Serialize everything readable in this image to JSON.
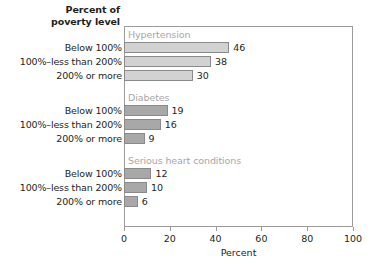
{
  "header": {
    "line1": "Percent of",
    "line2": "poverty level"
  },
  "axis": {
    "x_label": "Percent",
    "ticks": [
      "0",
      "20",
      "40",
      "60",
      "80",
      "100"
    ]
  },
  "colors": {
    "bar_light": "#d2d2d2",
    "bar_dark": "#a8a8a8",
    "bar_border": "#8a8a8a",
    "group_header": "#a6a6a6",
    "frame": "#9b9b9b",
    "text": "#231f20"
  },
  "groups": [
    {
      "name": "Hypertension",
      "tone": "light",
      "rows": [
        {
          "label": "Below 100%",
          "value": 46,
          "value_text": "46"
        },
        {
          "label": "100%–less than 200%",
          "value": 38,
          "value_text": "38"
        },
        {
          "label": "200% or more",
          "value": 30,
          "value_text": "30"
        }
      ]
    },
    {
      "name": "Diabetes",
      "tone": "dark",
      "rows": [
        {
          "label": "Below 100%",
          "value": 19,
          "value_text": "19"
        },
        {
          "label": "100%–less than 200%",
          "value": 16,
          "value_text": "16"
        },
        {
          "label": "200% or more",
          "value": 9,
          "value_text": "9"
        }
      ]
    },
    {
      "name": "Serious heart conditions",
      "tone": "dark",
      "rows": [
        {
          "label": "Below 100%",
          "value": 12,
          "value_text": "12"
        },
        {
          "label": "100%–less than 200%",
          "value": 10,
          "value_text": "10"
        },
        {
          "label": "200% or more",
          "value": 6,
          "value_text": "6"
        }
      ]
    }
  ],
  "chart_data": {
    "type": "bar",
    "orientation": "horizontal",
    "title": "",
    "xlabel": "Percent",
    "ylabel": "Percent of poverty level",
    "xlim": [
      0,
      100
    ],
    "xticks": [
      0,
      20,
      40,
      60,
      80,
      100
    ],
    "grid": false,
    "legend": "none",
    "categories": [
      "Below 100%",
      "100%–less than 200%",
      "200% or more"
    ],
    "series": [
      {
        "name": "Hypertension",
        "values": [
          46,
          38,
          30
        ]
      },
      {
        "name": "Diabetes",
        "values": [
          19,
          16,
          9
        ]
      },
      {
        "name": "Serious heart conditions",
        "values": [
          12,
          10,
          6
        ]
      }
    ]
  }
}
